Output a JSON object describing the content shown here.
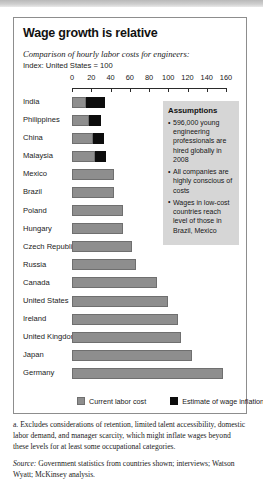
{
  "exhibit": {
    "title": "Wage growth is relative",
    "subtitle": "Comparison of hourly labor costs for engineers:",
    "index_note": "Index: United States = 100"
  },
  "legend": {
    "base_label": "Current labor cost",
    "inflation_label": "Estimate of wage inflation",
    "inflation_marker": "a"
  },
  "assumptions": {
    "heading": "Assumptions",
    "items": [
      "596,000 young engineering professionals are hired globally in 2008",
      "All companies are highly conscious of costs",
      "Wages in low-cost countries reach level of those in Brazil, Mexico"
    ]
  },
  "notes": {
    "footnote_a": "a. Excludes considerations of retention, limited talent accessibility, domestic labor demand, and manager scarcity, which might inflate wages beyond these levels for at least some occupational categories.",
    "source_label": "Source:",
    "source_text": " Government statistics from countries shown; interviews; Watson Wyatt; McKinsey analysis."
  },
  "chart_data": {
    "type": "bar",
    "orientation": "horizontal",
    "stacked": true,
    "title": "Wage growth is relative",
    "subtitle": "Comparison of hourly labor costs for engineers:",
    "xlabel": "Index: United States = 100",
    "ylabel": "",
    "xlim": [
      0,
      160
    ],
    "xticks": [
      0,
      20,
      40,
      60,
      80,
      100,
      120,
      140,
      160
    ],
    "grid": false,
    "legend_position": "bottom",
    "categories": [
      "India",
      "Philippines",
      "China",
      "Malaysia",
      "Mexico",
      "Brazil",
      "Poland",
      "Hungary",
      "Czech Republic",
      "Russia",
      "Canada",
      "United States",
      "Ireland",
      "United Kingdom",
      "Japan",
      "Germany"
    ],
    "series": [
      {
        "name": "Current labor cost",
        "color": "#8e8e8e",
        "values": [
          15,
          18,
          22,
          24,
          44,
          44,
          53,
          53,
          62,
          66,
          88,
          100,
          110,
          113,
          125,
          157
        ]
      },
      {
        "name": "Estimate of wage inflation",
        "color": "#0d0d0d",
        "values": [
          19,
          12,
          11,
          11,
          0,
          0,
          0,
          0,
          0,
          0,
          0,
          0,
          0,
          0,
          0,
          0
        ]
      }
    ]
  }
}
